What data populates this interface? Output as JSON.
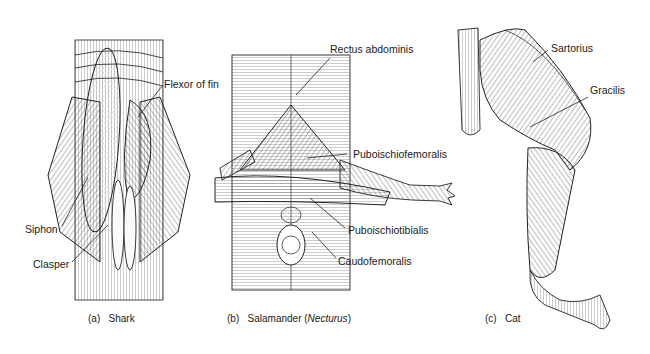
{
  "figure": {
    "panels": [
      {
        "id": "a",
        "caption_letter": "(a)",
        "caption_name": "Shark",
        "labels": [
          "Flexor of fin",
          "Siphon",
          "Clasper"
        ]
      },
      {
        "id": "b",
        "caption_letter": "(b)",
        "caption_name": "Salamander (",
        "caption_italic": "Necturus",
        "caption_suffix": ")",
        "labels": [
          "Rectus abdominis",
          "Puboischiofemoralis",
          "Puboischiotibialis",
          "Caudofemoralis"
        ]
      },
      {
        "id": "c",
        "caption_letter": "(c)",
        "caption_name": "Cat",
        "labels": [
          "Sartorius",
          "Gracilis"
        ]
      }
    ]
  }
}
